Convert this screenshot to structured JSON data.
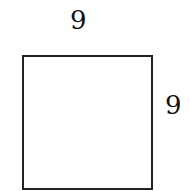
{
  "diagram": {
    "shape": "square",
    "labels": {
      "top": "9",
      "right": "9"
    },
    "colors": {
      "stroke": "#222222",
      "text": "#111111",
      "background": "#ffffff"
    }
  }
}
